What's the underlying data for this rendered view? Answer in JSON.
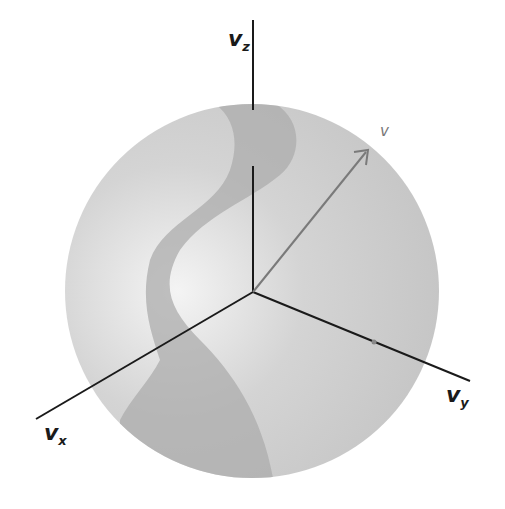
{
  "figure": {
    "type": "velocity-space-sphere",
    "axes": {
      "z": {
        "symbol": "v",
        "subscript": "z"
      },
      "y": {
        "symbol": "v",
        "subscript": "y"
      },
      "x": {
        "symbol": "v",
        "subscript": "x"
      }
    },
    "vector": {
      "label": "v"
    },
    "colors": {
      "sphere_light": "#e8e8e8",
      "sphere_base": "#c9c9c9",
      "band_dark": "#a8a8a8",
      "axis": "#1a1a1a",
      "vector": "#7a7a7a"
    }
  }
}
